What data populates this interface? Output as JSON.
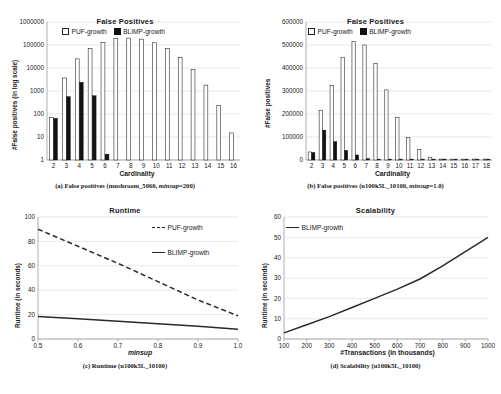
{
  "figure": {
    "panels": [
      "a",
      "b",
      "c",
      "d"
    ]
  },
  "panel_a": {
    "title": "False Positives",
    "caption_prefix": "(a) False positives (mushroom_5060, ",
    "caption_italic": "minsup",
    "caption_suffix": "=200)",
    "legend": [
      "PUF-growth",
      "BLIMP-growth"
    ]
  },
  "panel_b": {
    "title": "False Positives",
    "caption_prefix": "(b) False positives (u100k5L_10100, ",
    "caption_italic": "minsup",
    "caption_suffix": "=1.0)",
    "legend": [
      "PUF-growth",
      "BLIMP-growth"
    ]
  },
  "panel_c": {
    "title": "Runtime",
    "caption_prefix": "(c) Runtime (u100k5L_10100)",
    "caption_italic": "",
    "caption_suffix": "",
    "legend": [
      "PUF-growth",
      "BLIMP-growth"
    ]
  },
  "panel_d": {
    "title": "Scalability",
    "caption_prefix": "(d) Scalability (u100k5L_10100)",
    "caption_italic": "",
    "caption_suffix": "",
    "legend": [
      "BLIMP-growth"
    ]
  },
  "chart_data": [
    {
      "id": "a",
      "type": "bar",
      "title": "False Positives",
      "xlabel": "Cardinality",
      "ylabel": "#False positives (in log  scale)",
      "yscale": "log",
      "ylim": [
        1,
        1000000
      ],
      "yticks": [
        1,
        10,
        100,
        1000,
        10000,
        100000,
        1000000
      ],
      "ytick_labels": [
        "1",
        "10",
        "100",
        "1000",
        "10000",
        "100000",
        "1000000"
      ],
      "categories": [
        "2",
        "3",
        "4",
        "5",
        "6",
        "7",
        "8",
        "9",
        "10",
        "11",
        "12",
        "13",
        "14",
        "15",
        "16"
      ],
      "grid": true,
      "legend_position": "top-left",
      "series": [
        {
          "name": "PUF-growth",
          "style": "open-bar",
          "values": [
            70,
            3700,
            25000,
            70000,
            130000,
            190000,
            200000,
            180000,
            125000,
            70000,
            28000,
            8500,
            1800,
            230,
            15
          ]
        },
        {
          "name": "BLIMP-growth",
          "style": "filled-bar",
          "values": [
            65,
            570,
            2400,
            620,
            1.8,
            0,
            0,
            0,
            0,
            0,
            0,
            0,
            0,
            0,
            0
          ]
        }
      ]
    },
    {
      "id": "b",
      "type": "bar",
      "title": "False Positives",
      "xlabel": "Cardinality",
      "ylabel": "#False positives",
      "yscale": "linear",
      "ylim": [
        0,
        600000
      ],
      "yticks": [
        0,
        100000,
        200000,
        300000,
        400000,
        500000,
        600000
      ],
      "ytick_labels": [
        "0",
        "100000",
        "200000",
        "300000",
        "400000",
        "500000",
        "600000"
      ],
      "categories": [
        "2",
        "3",
        "4",
        "5",
        "6",
        "7",
        "8",
        "9",
        "10",
        "11",
        "12",
        "13",
        "14",
        "15",
        "16",
        "17",
        "18"
      ],
      "grid": true,
      "legend_position": "top-left",
      "series": [
        {
          "name": "PUF-growth",
          "style": "open-bar",
          "values": [
            35000,
            215000,
            325000,
            445000,
            515000,
            500000,
            420000,
            305000,
            185000,
            98000,
            45000,
            12000,
            3000,
            1000,
            500,
            200,
            100
          ]
        },
        {
          "name": "BLIMP-growth",
          "style": "filled-bar",
          "values": [
            33000,
            130000,
            80000,
            42000,
            22000,
            6000,
            1500,
            400,
            100,
            0,
            0,
            0,
            0,
            0,
            0,
            0,
            0
          ]
        }
      ]
    },
    {
      "id": "c",
      "type": "line",
      "title": "Runtime",
      "xlabel": "minsup",
      "ylabel": "Runtime (in seconds)",
      "xlim": [
        0.5,
        1.0
      ],
      "ylim": [
        0,
        100
      ],
      "xticks": [
        0.5,
        0.6,
        0.7,
        0.8,
        0.9,
        1.0
      ],
      "xtick_labels": [
        "0.5",
        "0.6",
        "0.7",
        "0.8",
        "0.9",
        "1.0"
      ],
      "yticks": [
        0,
        20,
        40,
        60,
        80,
        100
      ],
      "ytick_labels": [
        "0",
        "20",
        "40",
        "60",
        "80",
        "100"
      ],
      "grid": true,
      "legend_position": "top-right",
      "series": [
        {
          "name": "PUF-growth",
          "style": "dashed-line",
          "x": [
            0.5,
            0.6,
            0.7,
            0.8,
            0.9,
            1.0
          ],
          "values": [
            90,
            76,
            62,
            47,
            32,
            19
          ]
        },
        {
          "name": "BLIMP-growth",
          "style": "solid-line",
          "x": [
            0.5,
            0.6,
            0.7,
            0.8,
            0.9,
            1.0
          ],
          "values": [
            18.5,
            16.5,
            14.5,
            12.5,
            10.5,
            8
          ]
        }
      ]
    },
    {
      "id": "d",
      "type": "line",
      "title": "Scalability",
      "xlabel": "#Transactions (in thousands)",
      "ylabel": "Runtime (in seconds)",
      "xlim": [
        100,
        1000
      ],
      "ylim": [
        0,
        60
      ],
      "xticks": [
        100,
        200,
        300,
        400,
        500,
        600,
        700,
        800,
        900,
        1000
      ],
      "xtick_labels": [
        "100",
        "200",
        "300",
        "400",
        "500",
        "600",
        "700",
        "800",
        "900",
        "1000"
      ],
      "yticks": [
        0,
        10,
        20,
        30,
        40,
        50,
        60
      ],
      "ytick_labels": [
        "0",
        "10",
        "20",
        "30",
        "40",
        "50",
        "60"
      ],
      "grid": true,
      "legend_position": "top-left",
      "series": [
        {
          "name": "BLIMP-growth",
          "style": "solid-line",
          "x": [
            100,
            200,
            300,
            400,
            500,
            600,
            700,
            800,
            900,
            1000
          ],
          "values": [
            3,
            7,
            11,
            15.5,
            20,
            24.5,
            29.5,
            36,
            43,
            50
          ]
        }
      ]
    }
  ]
}
